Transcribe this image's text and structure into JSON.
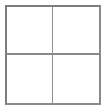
{
  "widget": {
    "name": "two-by-two-grid",
    "columns": 2,
    "rows": 4,
    "border_color": "#7d7d7d",
    "divider_color": "#8a8a8a",
    "cell_background": "#ffffff",
    "page_background": "#ffffff"
  },
  "cells": [
    {
      "id": "cell-top-left",
      "label": ""
    },
    {
      "id": "cell-top-right",
      "label": ""
    },
    {
      "id": "cell-bottom-left",
      "label": ""
    },
    {
      "id": "cell-bottom-right",
      "label": ""
    }
  ]
}
